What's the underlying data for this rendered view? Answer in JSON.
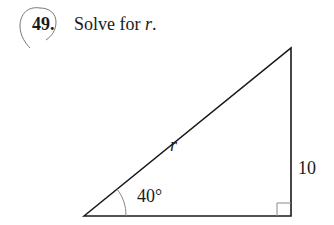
{
  "problem": {
    "number": "49.",
    "instruction_prefix": "Solve for ",
    "variable": "r",
    "instruction_suffix": "."
  },
  "figure": {
    "type": "right-triangle",
    "hypotenuse_label": "r",
    "opposite_side_label": "10",
    "angle_label": "40°",
    "right_angle_marker": true,
    "colors": {
      "stroke": "#1a1a1a",
      "arc": "#888888",
      "circle": "#777777"
    }
  }
}
